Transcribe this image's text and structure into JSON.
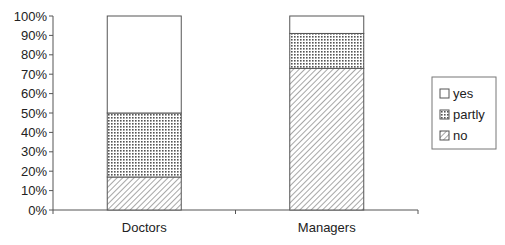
{
  "chart_data": {
    "type": "bar",
    "stacked": true,
    "percent": true,
    "title": "",
    "xlabel": "",
    "ylabel": "",
    "ylim": [
      0,
      100
    ],
    "yticks": [
      "0%",
      "10%",
      "20%",
      "30%",
      "40%",
      "50%",
      "60%",
      "70%",
      "80%",
      "90%",
      "100%"
    ],
    "categories": [
      "Doctors",
      "Managers"
    ],
    "series": [
      {
        "name": "no",
        "pattern": "diagonal-hatch",
        "values": [
          17,
          73
        ]
      },
      {
        "name": "partly",
        "pattern": "dotted-grid",
        "values": [
          33,
          18
        ]
      },
      {
        "name": "yes",
        "pattern": "blank",
        "values": [
          50,
          9
        ]
      }
    ],
    "legend": {
      "position": "right",
      "entries": [
        "yes",
        "partly",
        "no"
      ]
    },
    "grid": false
  },
  "colors": {
    "axis": "#555555",
    "bar_edge": "#555555",
    "pattern_ink": "#666666",
    "background": "#ffffff"
  }
}
